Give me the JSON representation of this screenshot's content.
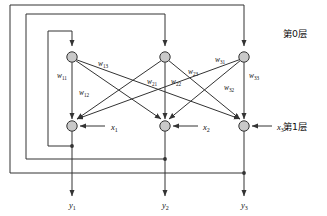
{
  "figure": {
    "type": "neural-network-diagram",
    "title": "",
    "background_color": "#ffffff",
    "line_color": "#333333",
    "node_fill": "#c9c9c9",
    "node_stroke": "#333333",
    "text_color": "#111111"
  },
  "layers": {
    "top_label": "第0层",
    "bottom_label": "第1层"
  },
  "nodes": {
    "layer0": [
      {
        "id": "n0-1",
        "cx": 72,
        "cy": 57,
        "r": 5.2
      },
      {
        "id": "n0-2",
        "cx": 165,
        "cy": 57,
        "r": 5.2
      },
      {
        "id": "n0-3",
        "cx": 244,
        "cy": 57,
        "r": 5.2
      }
    ],
    "layer1": [
      {
        "id": "n1-1",
        "cx": 72,
        "cy": 126,
        "r": 5.2
      },
      {
        "id": "n1-2",
        "cx": 165,
        "cy": 126,
        "r": 5.2
      },
      {
        "id": "n1-3",
        "cx": 244,
        "cy": 126,
        "r": 5.2
      }
    ]
  },
  "weights": [
    {
      "name": "w11",
      "base": "w",
      "sub": "11",
      "x": 57,
      "y": 78
    },
    {
      "name": "w12",
      "base": "w",
      "sub": "12",
      "x": 79,
      "y": 95
    },
    {
      "name": "w13",
      "base": "w",
      "sub": "13",
      "x": 98,
      "y": 66
    },
    {
      "name": "w21",
      "base": "w",
      "sub": "21",
      "x": 147,
      "y": 84
    },
    {
      "name": "w22",
      "base": "w",
      "sub": "22",
      "x": 171,
      "y": 84
    },
    {
      "name": "w23",
      "base": "w",
      "sub": "23",
      "x": 188,
      "y": 74
    },
    {
      "name": "w31",
      "base": "w",
      "sub": "31",
      "x": 215,
      "y": 62
    },
    {
      "name": "w32",
      "base": "w",
      "sub": "32",
      "x": 224,
      "y": 90
    },
    {
      "name": "w33",
      "base": "w",
      "sub": "33",
      "x": 249,
      "y": 78
    }
  ],
  "inputs": [
    {
      "name": "x1",
      "base": "x",
      "sub": "1",
      "x": 111,
      "y": 130,
      "arrow_from_x": 105,
      "arrow_to_x": 80,
      "arrow_y": 126
    },
    {
      "name": "x2",
      "base": "x",
      "sub": "2",
      "x": 203,
      "y": 130,
      "arrow_from_x": 198,
      "arrow_to_x": 173,
      "arrow_y": 126
    },
    {
      "name": "x3",
      "base": "x",
      "sub": "3",
      "x": 277,
      "y": 130,
      "arrow_from_x": 272,
      "arrow_to_x": 252,
      "arrow_y": 126
    }
  ],
  "outputs": [
    {
      "name": "y1",
      "base": "y",
      "sub": "1",
      "x": 69,
      "y": 208,
      "line_x": 72
    },
    {
      "name": "y2",
      "base": "y",
      "sub": "2",
      "x": 162,
      "y": 208,
      "line_x": 165
    },
    {
      "name": "y3",
      "base": "y",
      "sub": "3",
      "x": 241,
      "y": 208,
      "line_x": 244
    }
  ],
  "feedback_loops": [
    {
      "name": "loop-inner",
      "left": 48,
      "top": 31,
      "right": 72,
      "bottom": 146,
      "tap_x": 72,
      "tap_y": 146
    },
    {
      "name": "loop-middle",
      "left": 26,
      "top": 14,
      "right": 165,
      "bottom": 159,
      "tap_x": 165,
      "tap_y": 159
    },
    {
      "name": "loop-outer",
      "left": 10,
      "top": 5,
      "right": 244,
      "bottom": 173,
      "tap_x": 244,
      "tap_y": 173
    }
  ],
  "edge_count": 9
}
